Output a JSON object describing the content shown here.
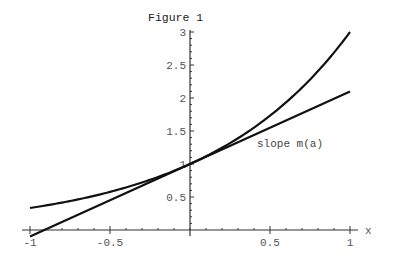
{
  "chart_data": {
    "type": "line",
    "title": "Figure 1",
    "xlabel": "x",
    "ylabel": "",
    "xlim": [
      -1,
      1
    ],
    "ylim": [
      0,
      3
    ],
    "grid": false,
    "legend": null,
    "x_ticks": [
      {
        "value": -1,
        "label": "-1"
      },
      {
        "value": -0.5,
        "label": "-0.5"
      },
      {
        "value": 0.5,
        "label": "0.5"
      },
      {
        "value": 1,
        "label": "1"
      }
    ],
    "y_ticks": [
      {
        "value": 0.5,
        "label": "0.5"
      },
      {
        "value": 1,
        "label": "1"
      },
      {
        "value": 1.5,
        "label": "1.5"
      },
      {
        "value": 2,
        "label": "2"
      },
      {
        "value": 2.5,
        "label": "2.5"
      },
      {
        "value": 3,
        "label": "3"
      }
    ],
    "series": [
      {
        "name": "exponential curve 3^x",
        "x": [
          -1,
          -0.75,
          -0.5,
          -0.25,
          0,
          0.25,
          0.5,
          0.75,
          1
        ],
        "values": [
          0.333,
          0.439,
          0.577,
          0.76,
          1.0,
          1.316,
          1.732,
          2.28,
          3.0
        ]
      },
      {
        "name": "tangent line at x=0",
        "x": [
          -1,
          1
        ],
        "values": [
          -0.099,
          2.099
        ]
      }
    ],
    "annotations": [
      {
        "text": "slope m(a)",
        "x": 0.42,
        "y": 1.32
      }
    ]
  }
}
